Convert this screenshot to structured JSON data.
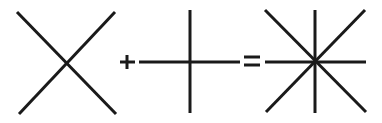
{
  "diagram": {
    "colors": {
      "background": "#ffffff",
      "stroke": "#1a1a1a"
    },
    "stroke_width": 3,
    "operand_1": {
      "name": "x-shape",
      "lines": [
        {
          "x1": 17,
          "y1": 12,
          "x2": 116,
          "y2": 114
        },
        {
          "x1": 115,
          "y1": 12,
          "x2": 19,
          "y2": 114
        }
      ]
    },
    "operator_plus": {
      "symbol": "+",
      "lines": [
        {
          "x1": 120,
          "y1": 62,
          "x2": 135,
          "y2": 62
        },
        {
          "x1": 127,
          "y1": 55,
          "x2": 127,
          "y2": 69
        }
      ]
    },
    "operand_2": {
      "name": "cross-shape",
      "lines": [
        {
          "x1": 139,
          "y1": 62,
          "x2": 240,
          "y2": 62
        },
        {
          "x1": 190,
          "y1": 10,
          "x2": 190,
          "y2": 113
        }
      ]
    },
    "operator_equals": {
      "symbol": "=",
      "lines": [
        {
          "x1": 244,
          "y1": 57,
          "x2": 260,
          "y2": 57
        },
        {
          "x1": 244,
          "y1": 65,
          "x2": 260,
          "y2": 65
        }
      ]
    },
    "result": {
      "name": "eight-pointed-star",
      "lines": [
        {
          "x1": 265,
          "y1": 62,
          "x2": 366,
          "y2": 62
        },
        {
          "x1": 315,
          "y1": 10,
          "x2": 315,
          "y2": 113
        },
        {
          "x1": 265,
          "y1": 10,
          "x2": 366,
          "y2": 112
        },
        {
          "x1": 365,
          "y1": 10,
          "x2": 266,
          "y2": 112
        }
      ]
    }
  }
}
